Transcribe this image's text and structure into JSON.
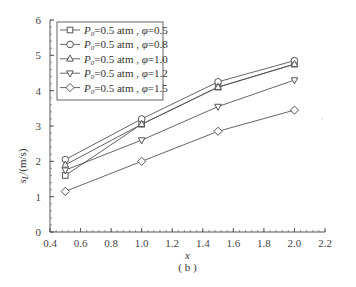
{
  "chart_data": {
    "type": "line",
    "title": "",
    "caption": "( b )",
    "xlabel": "x",
    "ylabel": "s_L/(m/s)",
    "xlim": [
      0.4,
      2.2
    ],
    "ylim": [
      0,
      6
    ],
    "xticks": [
      "0.4",
      "0.6",
      "0.8",
      "1.0",
      "1.2",
      "1.4",
      "1.6",
      "1.8",
      "2.0",
      "2.2"
    ],
    "yticks": [
      "0",
      "1",
      "2",
      "3",
      "4",
      "5",
      "6"
    ],
    "grid": false,
    "legend_position": "upper left",
    "x": [
      0.5,
      1.0,
      1.5,
      2.0
    ],
    "series": [
      {
        "name": "P0=0.5 atm, φ=0.5",
        "marker": "square",
        "values": [
          1.6,
          3.05,
          4.1,
          4.75
        ]
      },
      {
        "name": "P0=0.5 atm, φ=0.8",
        "marker": "circle",
        "values": [
          2.05,
          3.2,
          4.25,
          4.85
        ]
      },
      {
        "name": "P0=0.5 atm, φ=1.0",
        "marker": "triangle-up",
        "values": [
          1.9,
          3.05,
          4.1,
          4.75
        ]
      },
      {
        "name": "P0=0.5 atm, φ=1.2",
        "marker": "triangle-down",
        "values": [
          1.75,
          2.6,
          3.55,
          4.3
        ]
      },
      {
        "name": "P0=0.5 atm, φ=1.5",
        "marker": "diamond",
        "values": [
          1.15,
          2.0,
          2.85,
          3.45
        ]
      }
    ]
  },
  "legend": [
    {
      "p": "P",
      "sub": "0",
      "text": "=0.5 atm , ",
      "phi": "φ",
      "val": "=0.5"
    },
    {
      "p": "P",
      "sub": "0",
      "text": "=0.5 atm , ",
      "phi": "φ",
      "val": "=0.8"
    },
    {
      "p": "P",
      "sub": "0",
      "text": "=0.5 atm , ",
      "phi": "φ",
      "val": "=1.0"
    },
    {
      "p": "P",
      "sub": "0",
      "text": "=0.5 atm , ",
      "phi": "φ",
      "val": "=1.2"
    },
    {
      "p": "P",
      "sub": "0",
      "text": "=0.5 atm , ",
      "phi": "φ",
      "val": "=1.5"
    }
  ]
}
